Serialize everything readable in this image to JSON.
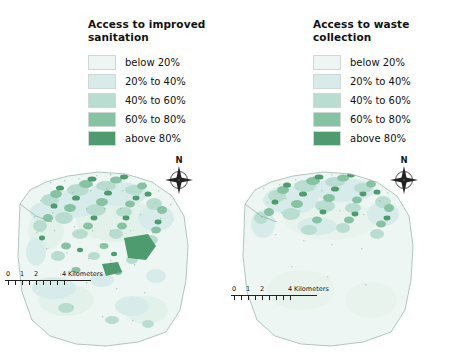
{
  "page": {
    "background": "#ffffff",
    "width": 450,
    "height": 357
  },
  "palette": {
    "class1": "#eef6f3",
    "class2": "#d7ecea",
    "class3": "#b9ddd0",
    "class4": "#86c3a3",
    "class5": "#4f9b6f",
    "outline": "#9fb8ae",
    "text": "#111111"
  },
  "legend_classes": [
    {
      "label": "below 20%",
      "color": "#eef6f3"
    },
    {
      "label": "20% to 40%",
      "color": "#d7ecea"
    },
    {
      "label": "40% to 60%",
      "color": "#b9ddd0"
    },
    {
      "label": "60% to 80%",
      "color": "#86c3a3"
    },
    {
      "label": "above 80%",
      "color": "#4f9b6f"
    }
  ],
  "panels": [
    {
      "title_line1": "Access to improved",
      "title_line2": "sanitation",
      "compass_label": "N",
      "scalebar": {
        "ticks": [
          "0",
          "1",
          "2",
          "4"
        ],
        "unit": "Kilometers"
      }
    },
    {
      "title_line1": "Access to waste",
      "title_line2": "collection",
      "compass_label": "N",
      "scalebar": {
        "ticks": [
          "0",
          "1",
          "2",
          "4"
        ],
        "unit": "Kilometers"
      }
    }
  ]
}
